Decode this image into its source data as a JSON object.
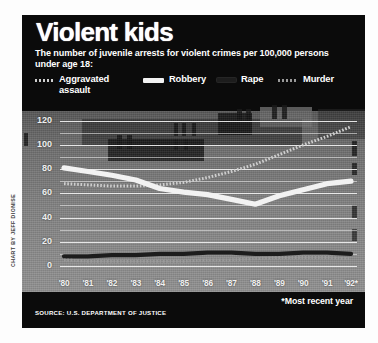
{
  "credit": "CHART BY JEFF DIONISE",
  "header": {
    "title": "Violent kids",
    "subtitle": "The number of juvenile arrests for violent crimes per 100,000 persons under age 18:"
  },
  "legend": {
    "items": [
      {
        "label": "Aggravated assault",
        "swatch": "dotted-white",
        "color": "#cfcfcf"
      },
      {
        "label": "Robbery",
        "swatch": "solid-white",
        "color": "#f2f2f2"
      },
      {
        "label": "Rape",
        "swatch": "solid-black",
        "color": "#1d1d1d"
      },
      {
        "label": "Murder",
        "swatch": "dotted-gray",
        "color": "#9a9a9a"
      }
    ]
  },
  "footer": {
    "source": "SOURCE: U.S. DEPARTMENT OF JUSTICE",
    "note": "*Most recent year"
  },
  "chart_data": {
    "type": "line",
    "title": "Violent kids",
    "subtitle": "The number of juvenile arrests for violent crimes per 100,000 persons under age 18:",
    "xlabel": "",
    "ylabel": "",
    "categories": [
      "'80",
      "'81",
      "'82",
      "'83",
      "'84",
      "'85",
      "'86",
      "'87",
      "'88",
      "'89",
      "'90",
      "'91",
      "'92*"
    ],
    "yticks": [
      0,
      20,
      40,
      60,
      80,
      100,
      120
    ],
    "ylim": [
      0,
      128
    ],
    "grid": true,
    "legend_position": "top",
    "annotations": [
      "*Most recent year"
    ],
    "series": [
      {
        "name": "Aggravated assault",
        "style": "dotted",
        "color": "#cfcfcf",
        "values": [
          68,
          67,
          66,
          66,
          67,
          69,
          73,
          78,
          84,
          92,
          100,
          107,
          115
        ]
      },
      {
        "name": "Robbery",
        "style": "solid-thick",
        "color": "#f2f2f2",
        "values": [
          81,
          78,
          75,
          71,
          64,
          61,
          59,
          55,
          51,
          58,
          63,
          68,
          70
        ]
      },
      {
        "name": "Rape",
        "style": "solid",
        "color": "#1d1d1d",
        "values": [
          8,
          8,
          9,
          9,
          10,
          10,
          11,
          11,
          10,
          10,
          11,
          11,
          10
        ]
      },
      {
        "name": "Murder",
        "style": "dotted",
        "color": "#9a9a9a",
        "values": [
          5,
          4,
          4,
          4,
          4,
          4,
          5,
          5,
          6,
          7,
          7,
          7,
          6
        ]
      }
    ]
  }
}
